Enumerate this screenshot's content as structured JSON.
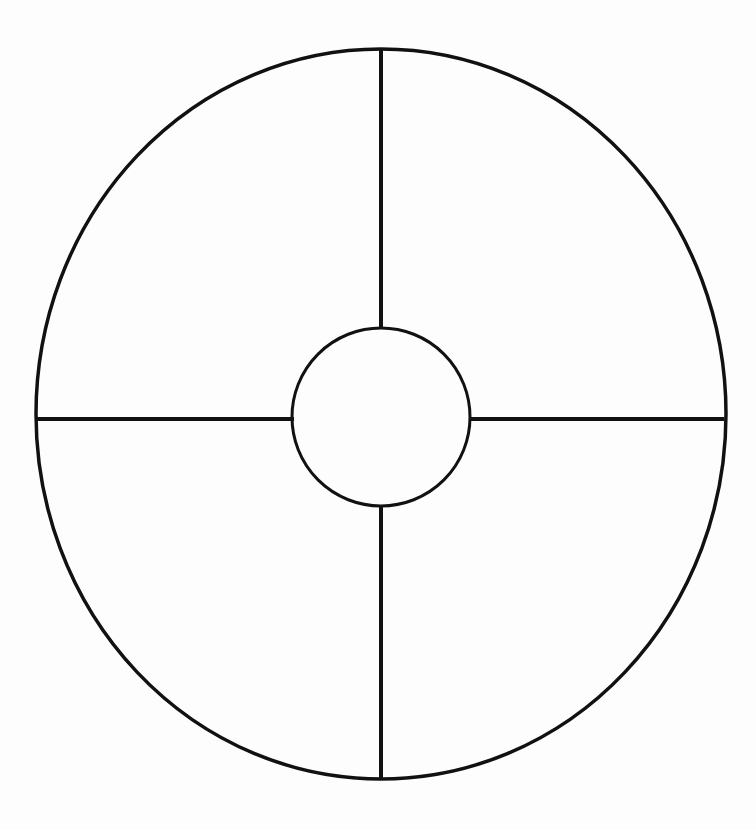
{
  "page": {
    "width": 756,
    "height": 830,
    "background_color": "#fdfdfd",
    "stroke_color": "#111111"
  },
  "chart_data": {
    "type": "pie",
    "title": "",
    "subtitle": "",
    "xlabel": "",
    "ylabel": "",
    "legend_position": "none",
    "grid": false,
    "annotations": [],
    "categories": [
      "Quadrant 1",
      "Quadrant 2",
      "Quadrant 3",
      "Quadrant 4"
    ],
    "values": [
      25,
      25,
      25,
      25
    ],
    "labels_visible": false,
    "donut_hole": true,
    "hole_ratio": 0.258,
    "start_angle": 90,
    "direction": "clockwise",
    "slice_labels": [
      "",
      "",
      "",
      ""
    ]
  },
  "geometry": {
    "outer_circle": {
      "name": "outer-circle",
      "center_x": 381,
      "center_y": 414,
      "radius_x": 345,
      "radius_y": 365,
      "stroke_width": 3.5,
      "stroke_color": "#111111",
      "fill": "none"
    },
    "inner_circle": {
      "name": "inner-circle",
      "center_x": 381,
      "center_y": 417,
      "radius": 89,
      "stroke_width": 3,
      "stroke_color": "#111111",
      "fill": "none"
    },
    "spokes": [
      {
        "name": "spoke-top",
        "orientation": "vertical",
        "x1": 381,
        "y1": 50,
        "x2": 381,
        "y2": 329,
        "stroke_width": 4
      },
      {
        "name": "spoke-bottom",
        "orientation": "vertical",
        "x1": 381,
        "y1": 506,
        "x2": 381,
        "y2": 778,
        "stroke_width": 4
      },
      {
        "name": "spoke-left",
        "orientation": "horizontal",
        "x1": 37,
        "y1": 419,
        "x2": 294,
        "y2": 419,
        "stroke_width": 4
      },
      {
        "name": "spoke-right",
        "orientation": "horizontal",
        "x1": 469,
        "y1": 419,
        "x2": 724,
        "y2": 419,
        "stroke_width": 4
      }
    ],
    "quadrant_hit_regions": [
      {
        "name": "quadrant-top-right",
        "cx": 540,
        "cy": 260
      },
      {
        "name": "quadrant-bottom-right",
        "cx": 540,
        "cy": 585
      },
      {
        "name": "quadrant-bottom-left",
        "cx": 215,
        "cy": 585
      },
      {
        "name": "quadrant-top-left",
        "cx": 215,
        "cy": 260
      }
    ]
  }
}
